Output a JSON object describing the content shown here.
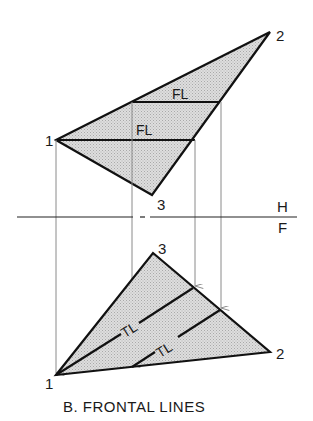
{
  "figure": {
    "caption": "B. FRONTAL LINES",
    "fold_line": {
      "upper_label": "H",
      "lower_label": "F"
    },
    "top_view": {
      "points": [
        {
          "label": "1",
          "x": 56,
          "y": 140
        },
        {
          "label": "2",
          "x": 270,
          "y": 32
        },
        {
          "label": "3",
          "x": 152,
          "y": 195
        }
      ],
      "lines": [
        {
          "label": "FL"
        },
        {
          "label": "FL"
        }
      ]
    },
    "front_view": {
      "points": [
        {
          "label": "1",
          "x": 56,
          "y": 375
        },
        {
          "label": "2",
          "x": 270,
          "y": 352
        },
        {
          "label": "3",
          "x": 153,
          "y": 253
        }
      ],
      "lines": [
        {
          "label": "TL"
        },
        {
          "label": "TL"
        }
      ]
    },
    "colors": {
      "line": "#111111",
      "projection": "#8a8a8a",
      "fill": "#cfcfcf"
    }
  }
}
